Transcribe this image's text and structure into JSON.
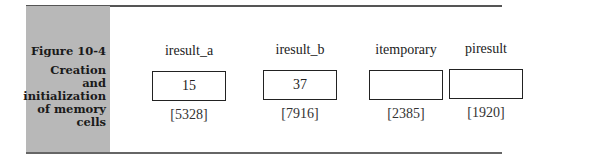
{
  "figure": {
    "number": "Figure 10-4",
    "title_lines": [
      "Creation and",
      "initialization",
      "of memory",
      "cells"
    ]
  },
  "cells": [
    {
      "name": "iresult_a",
      "value": "15",
      "address": "[5328]"
    },
    {
      "name": "iresult_b",
      "value": "37",
      "address": "[7916]"
    },
    {
      "name": "itemporary",
      "value": "",
      "address": "[2385]"
    },
    {
      "name": "piresult",
      "value": "",
      "address": "[1920]"
    }
  ]
}
